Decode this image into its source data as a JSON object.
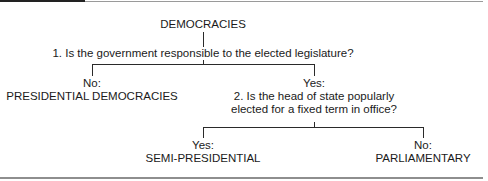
{
  "diagram": {
    "root": "DEMOCRACIES",
    "question1": "1. Is the government responsible to the elected legislature?",
    "branch1_no": {
      "answer": "No:",
      "result": "PRESIDENTIAL DEMOCRACIES"
    },
    "branch1_yes": {
      "answer": "Yes:",
      "question2_line1": "2. Is the head of state popularly",
      "question2_line2": "elected for a fixed term in office?"
    },
    "branch2_yes": {
      "answer": "Yes:",
      "result": "SEMI-PRESIDENTIAL"
    },
    "branch2_no": {
      "answer": "No:",
      "result": "PARLIAMENTARY"
    }
  },
  "colors": {
    "line": "#2a2a2a",
    "text": "#1a1a1a",
    "rule": "#9a9a9a"
  }
}
